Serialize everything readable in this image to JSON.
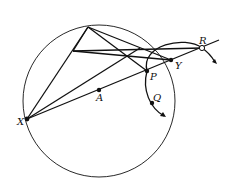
{
  "diagram": {
    "type": "geometry-construction",
    "labels": {
      "X": "X",
      "A": "A",
      "P": "P",
      "Q": "Q",
      "Y": "Y",
      "R": "R"
    },
    "colors": {
      "stroke": "#111111",
      "background": "#ffffff"
    }
  }
}
